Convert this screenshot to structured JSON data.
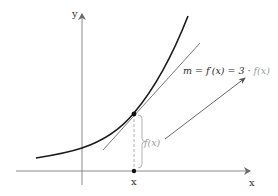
{
  "diagram": {
    "type": "function-tangent-illustration",
    "axes": {
      "x_label": "x",
      "y_label": "y"
    },
    "point_label": "x",
    "height_label": "f(x)",
    "formula": {
      "lhs": "m = f′(x) = 3 · ",
      "rhs": "f(x)"
    },
    "colors": {
      "curve": "#1a1a1a",
      "axes": "#8a8a8a",
      "tangent": "#6a6a6a",
      "annotation": "#9a9a9a",
      "background": "#ffffff"
    },
    "elements": [
      "exponential curve",
      "tangent line at point",
      "dashed vertical segment from point to x-axis",
      "brace marking f(x)",
      "arrow from f(x) label to formula"
    ]
  }
}
